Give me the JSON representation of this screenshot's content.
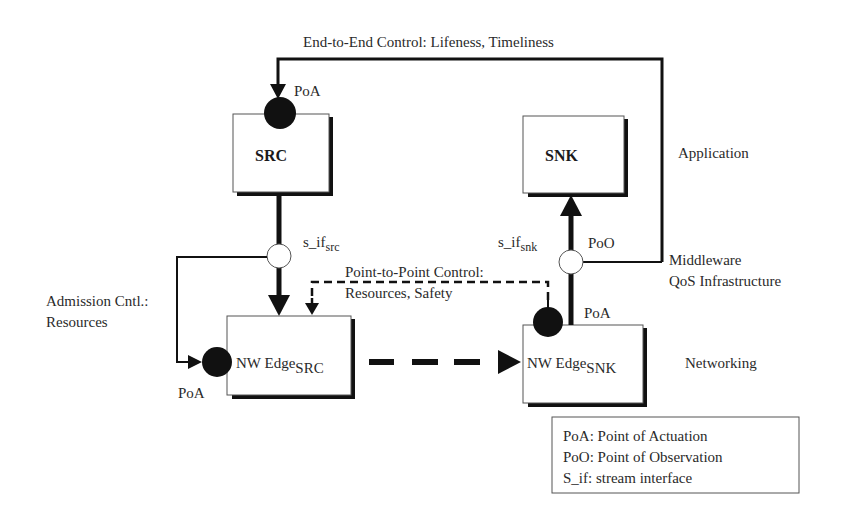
{
  "diagram": {
    "top_loop_label": "End-to-End Control: Lifeness, Timeliness",
    "nodes": {
      "src": {
        "label": "SRC"
      },
      "snk": {
        "label": "SNK"
      },
      "nw_edge_src": {
        "label": "NW Edge",
        "subscript": "SRC"
      },
      "nw_edge_snk": {
        "label": "NW Edge",
        "subscript": "SNK"
      }
    },
    "points": {
      "src_poa": "PoA",
      "src_if": {
        "label": "s_if",
        "subscript": "src"
      },
      "snk_if": {
        "label": "s_if",
        "subscript": "snk"
      },
      "snk_poo": "PoO",
      "nw_src_poa": "PoA",
      "nw_snk_poa": "PoA"
    },
    "control_labels": {
      "admission_line1": "Admission Cntl.:",
      "admission_line2": "Resources",
      "p2p_line1": "Point-to-Point Control:",
      "p2p_line2": "Resources, Safety"
    },
    "layers": {
      "application": "Application",
      "middleware_line1": "Middleware",
      "middleware_line2": "QoS Infrastructure",
      "networking": "Networking"
    },
    "legend": {
      "items": [
        "PoA: Point of Actuation",
        "PoO: Point of Observation",
        "S_if: stream interface"
      ]
    },
    "colors": {
      "line": "#111111",
      "text": "#2a2a2a",
      "background": "#ffffff"
    }
  }
}
